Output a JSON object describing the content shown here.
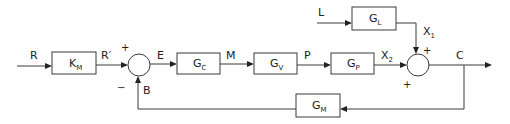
{
  "diagram": {
    "type": "feedback control block diagram",
    "blocks": [
      {
        "id": "km",
        "main": "K",
        "sub": "M"
      },
      {
        "id": "gc",
        "main": "G",
        "sub": "C"
      },
      {
        "id": "gv",
        "main": "G",
        "sub": "V"
      },
      {
        "id": "gp",
        "main": "G",
        "sub": "P"
      },
      {
        "id": "gl",
        "main": "G",
        "sub": "L"
      },
      {
        "id": "gm",
        "main": "G",
        "sub": "M"
      }
    ],
    "signals": {
      "r": "R",
      "r_prime": "R′",
      "e": "E",
      "m": "M",
      "p": "P",
      "x2_main": "X",
      "x2_sub": "2",
      "x1_main": "X",
      "x1_sub": "1",
      "l": "L",
      "c": "C",
      "b": "B"
    },
    "junctions": {
      "sum1": {
        "top_sign": "+",
        "bottom_sign": "−"
      },
      "sum2": {
        "top_sign": "+",
        "left_sign": "+"
      }
    },
    "colors": {
      "line": "#3a3a3a",
      "text": "#222222",
      "background": "#ffffff"
    }
  }
}
